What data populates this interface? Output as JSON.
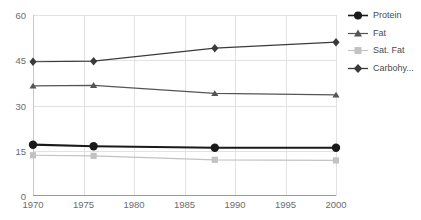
{
  "title_sliver": "",
  "chart_data": {
    "type": "line",
    "title": "",
    "xlabel": "",
    "ylabel": "",
    "x": [
      1970,
      1976,
      1988,
      2000
    ],
    "xlim": [
      1970,
      2000
    ],
    "ylim": [
      0,
      60
    ],
    "xticks": [
      "1970",
      "1975",
      "1980",
      "1985",
      "1990",
      "1995",
      "2000"
    ],
    "yticks": [
      "0",
      "15",
      "30",
      "45",
      "60"
    ],
    "grid": true,
    "legend_position": "right",
    "series": [
      {
        "name": "Protein",
        "marker": "circle",
        "color": "#1a1a1a",
        "values": [
          17,
          16.5,
          16,
          16
        ]
      },
      {
        "name": "Fat",
        "marker": "triangle",
        "color": "#555555",
        "values": [
          36.5,
          36.7,
          34,
          33.5
        ]
      },
      {
        "name": "Sat. Fat",
        "marker": "square",
        "color": "#c2c2c2",
        "values": [
          13.5,
          13.3,
          12,
          11.8
        ]
      },
      {
        "name": "Carbohy...",
        "marker": "diamond",
        "color": "#3a3a3a",
        "values": [
          44.5,
          44.7,
          49,
          51
        ]
      }
    ]
  },
  "legend": {
    "items": [
      {
        "label": "Protein"
      },
      {
        "label": "Fat"
      },
      {
        "label": "Sat. Fat"
      },
      {
        "label": "Carbohy..."
      }
    ]
  },
  "colors": {
    "grid": "#e2e2e2",
    "axis": "#9a9a9a",
    "tick_text": "#6b6b6b",
    "legend_text": "#4a4a4a",
    "background": "#ffffff"
  }
}
